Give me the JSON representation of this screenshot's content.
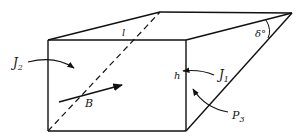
{
  "diagram": {
    "type": "wedge-prism",
    "labels": {
      "length": "l",
      "angle": "δ°",
      "height": "h",
      "j1": "J",
      "j1_sub": "1",
      "j2": "J",
      "j2_sub": "2",
      "b": "B",
      "p3": "P",
      "p3_sub": "3"
    },
    "colors": {
      "stroke": "#111111",
      "background": "#ffffff"
    }
  }
}
